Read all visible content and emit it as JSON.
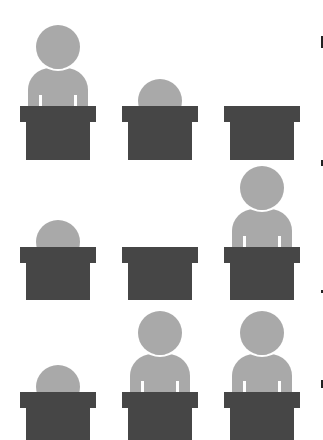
{
  "illustration": {
    "description": "3x3 grid of podiums with people in varying presence states",
    "colors": {
      "background": "#ffffff",
      "podium": "#464646",
      "person": "#a9a9a9"
    },
    "grid": [
      [
        "full",
        "peek",
        "empty"
      ],
      [
        "peek",
        "empty",
        "full"
      ],
      [
        "peek",
        "full",
        "full"
      ]
    ]
  }
}
